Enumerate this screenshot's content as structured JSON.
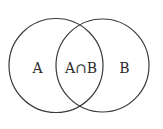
{
  "diagram": {
    "type": "venn",
    "sets": [
      {
        "id": "A",
        "label": "A"
      },
      {
        "id": "B",
        "label": "B"
      }
    ],
    "intersection": {
      "label": "A∩B"
    },
    "stroke_color": "#3a3a3a",
    "background": "#ffffff"
  }
}
